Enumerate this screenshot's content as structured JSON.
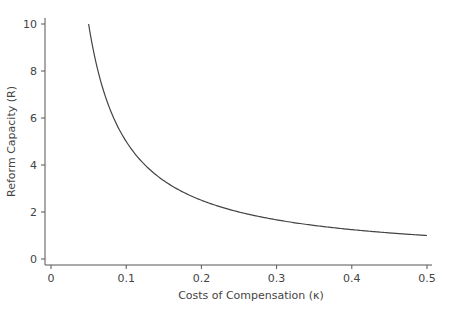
{
  "chart_data": {
    "type": "line",
    "title": "",
    "xlabel": "Costs of Compensation (κ)",
    "ylabel": "Reform Capacity (R)",
    "xlim": [
      0,
      0.5
    ],
    "ylim": [
      0,
      10
    ],
    "xticks": [
      0,
      0.1,
      0.2,
      0.3,
      0.4,
      0.5
    ],
    "xtick_labels": [
      "0",
      "0.1",
      "0.2",
      "0.3",
      "0.4",
      "0.5"
    ],
    "yticks": [
      0,
      2,
      4,
      6,
      8,
      10
    ],
    "ytick_labels": [
      "0",
      "2",
      "4",
      "6",
      "8",
      "10"
    ],
    "grid": false,
    "legend": "none",
    "series": [
      {
        "name": "R = 0.5 / κ",
        "color": "#444444",
        "x": [
          0.05,
          0.06,
          0.07,
          0.08,
          0.09,
          0.1,
          0.12,
          0.14,
          0.16,
          0.18,
          0.2,
          0.25,
          0.3,
          0.35,
          0.4,
          0.45,
          0.5
        ],
        "y": [
          10,
          8.33,
          7.14,
          6.25,
          5.56,
          5,
          4.17,
          3.57,
          3.13,
          2.78,
          2.5,
          2,
          1.67,
          1.43,
          1.25,
          1.11,
          1
        ]
      }
    ]
  }
}
